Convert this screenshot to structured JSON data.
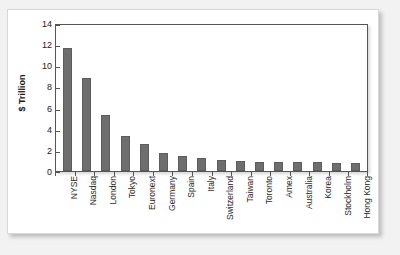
{
  "chart_data": {
    "type": "bar",
    "title": "",
    "xlabel": "",
    "ylabel": "$ Trillion",
    "ylim": [
      0,
      14
    ],
    "yticks": [
      0,
      2,
      4,
      6,
      8,
      10,
      12,
      14
    ],
    "grid": false,
    "legend": false,
    "bar_color": "#6e6e6e",
    "categories": [
      "NYSE",
      "Nasdaq",
      "London",
      "Tokyo",
      "Euronext",
      "Germany",
      "Spain",
      "Italy",
      "Switzerland",
      "Taiwan",
      "Toronto",
      "Amex",
      "Australia",
      "Korea",
      "Stockholm",
      "Hong Kong"
    ],
    "values": [
      11.6,
      8.8,
      5.3,
      3.3,
      2.6,
      1.7,
      1.4,
      1.2,
      1.0,
      0.95,
      0.9,
      0.88,
      0.85,
      0.82,
      0.78,
      0.75
    ]
  },
  "colors": {
    "page_background": "#f2f2f2",
    "card_background": "#ffffff",
    "axis": "#555555",
    "text": "#222222"
  }
}
